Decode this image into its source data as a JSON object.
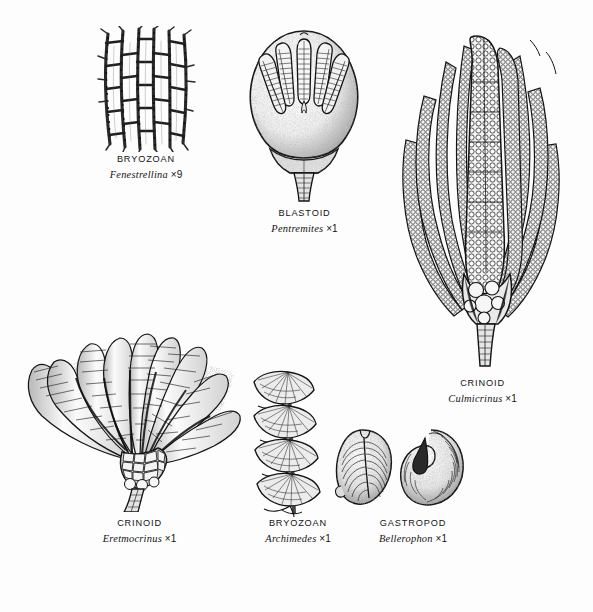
{
  "plate": {
    "background_color": "#fdfdfd",
    "ink_color": "#141414",
    "width": 593,
    "height": 612
  },
  "specimens": [
    {
      "id": "fenestrellina",
      "common_name": "BRYOZOAN",
      "genus": "Fenestrellina",
      "magnification": "×9",
      "icon_name": "fenestrate-bryozoan-mesh-illustration"
    },
    {
      "id": "pentremites",
      "common_name": "BLASTOID",
      "genus": "Pentremites",
      "magnification": "×1",
      "icon_name": "blastoid-calyx-illustration"
    },
    {
      "id": "culmicrinus",
      "common_name": "CRINOID",
      "genus": "Culmicrinus",
      "magnification": "×1",
      "icon_name": "crinoid-crown-beaded-arms-illustration"
    },
    {
      "id": "eretmocrinus",
      "common_name": "CRINOID",
      "genus": "Eretmocrinus",
      "magnification": "×1",
      "icon_name": "crinoid-fan-paddle-arms-illustration"
    },
    {
      "id": "archimedes",
      "common_name": "BRYOZOAN",
      "genus": "Archimedes",
      "magnification": "×1",
      "icon_name": "screw-bryozoan-spiral-illustration"
    },
    {
      "id": "bellerophon",
      "common_name": "GASTROPOD",
      "genus": "Bellerophon",
      "magnification": "×1",
      "icon_name": "coiled-gastropod-shell-two-views-illustration"
    }
  ]
}
